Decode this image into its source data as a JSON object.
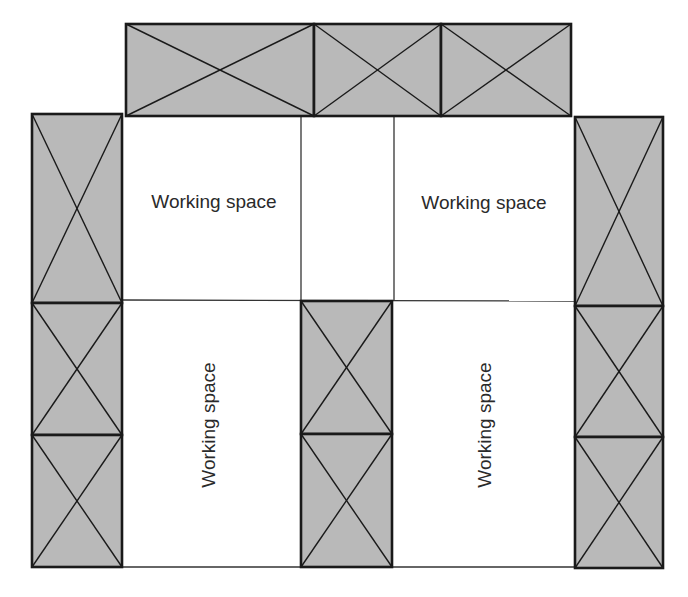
{
  "diagram": {
    "type": "floor-layout",
    "colors": {
      "background": "#ffffff",
      "rack_fill": "#b9b9b9",
      "rack_stroke": "#1a1a1a",
      "grid_line": "#333333",
      "label_text": "#2a2a2a"
    },
    "labels": {
      "top_left": "Working space",
      "top_right": "Working space",
      "bottom_left": "Working space",
      "bottom_right": "Working space"
    },
    "racks": [
      {
        "id": "top-1",
        "x": 126,
        "y": 24,
        "w": 188,
        "h": 92
      },
      {
        "id": "top-2",
        "x": 314,
        "y": 24,
        "w": 127,
        "h": 92
      },
      {
        "id": "top-3",
        "x": 441,
        "y": 24,
        "w": 130,
        "h": 92
      },
      {
        "id": "left-1",
        "x": 32,
        "y": 114,
        "w": 90,
        "h": 189
      },
      {
        "id": "left-2",
        "x": 32,
        "y": 303,
        "w": 90,
        "h": 132
      },
      {
        "id": "left-3",
        "x": 32,
        "y": 435,
        "w": 90,
        "h": 132
      },
      {
        "id": "mid-1",
        "x": 301,
        "y": 301,
        "w": 91,
        "h": 133
      },
      {
        "id": "mid-2",
        "x": 301,
        "y": 434,
        "w": 91,
        "h": 133
      },
      {
        "id": "right-1",
        "x": 575,
        "y": 117,
        "w": 88,
        "h": 189
      },
      {
        "id": "right-2",
        "x": 575,
        "y": 306,
        "w": 88,
        "h": 131
      },
      {
        "id": "right-3",
        "x": 575,
        "y": 437,
        "w": 88,
        "h": 131
      }
    ]
  }
}
